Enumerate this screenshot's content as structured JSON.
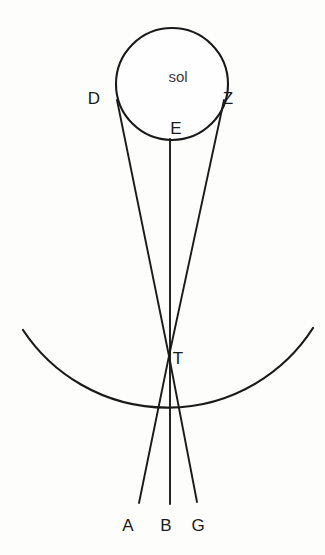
{
  "figure": {
    "title": "sol",
    "background_color": "#fdfdfb",
    "stroke_color": "#1a1a1a",
    "canvas": {
      "width": 325,
      "height": 555
    }
  },
  "sun": {
    "label": "sol",
    "label_x": 178,
    "label_y": 82,
    "center_x": 172,
    "center_y": 84,
    "radius": 56,
    "fill": "#fefefe"
  },
  "points": {
    "D": {
      "label": "D",
      "x": 117,
      "y": 100,
      "label_x": 94,
      "label_y": 104
    },
    "Z": {
      "label": "Z",
      "x": 224,
      "y": 100,
      "label_x": 228,
      "label_y": 104
    },
    "E": {
      "label": "E",
      "x": 170,
      "y": 139,
      "label_x": 176,
      "label_y": 134
    },
    "T": {
      "label": "T",
      "x": 169,
      "y": 356,
      "label_x": 178,
      "label_y": 364
    },
    "A": {
      "label": "A",
      "x": 139,
      "y": 503,
      "label_x": 128,
      "label_y": 531
    },
    "B": {
      "label": "B",
      "x": 170,
      "y": 504,
      "label_x": 166,
      "label_y": 531
    },
    "G": {
      "label": "G",
      "x": 197,
      "y": 502,
      "label_x": 198,
      "label_y": 531
    }
  },
  "rays": [
    {
      "name": "ray-D-to-G",
      "from": "D",
      "to": "G",
      "d": "M 117 100 L 169 356 L 197 502"
    },
    {
      "name": "ray-Z-to-A",
      "from": "Z",
      "to": "A",
      "d": "M 224 100 L 169 356 L 139 503"
    },
    {
      "name": "axis-E-to-B",
      "from": "E",
      "to": "B",
      "d": "M 170 139 L 170 504"
    }
  ],
  "earth_arc": {
    "name": "earth-arc",
    "d": "M 23 330 A 173 173 0 0 0 313 328",
    "left_x": 23,
    "left_y": 330,
    "right_x": 313,
    "right_y": 328,
    "bottom_y": 505,
    "center_x": 168,
    "center_y": 332,
    "radius": 173
  }
}
